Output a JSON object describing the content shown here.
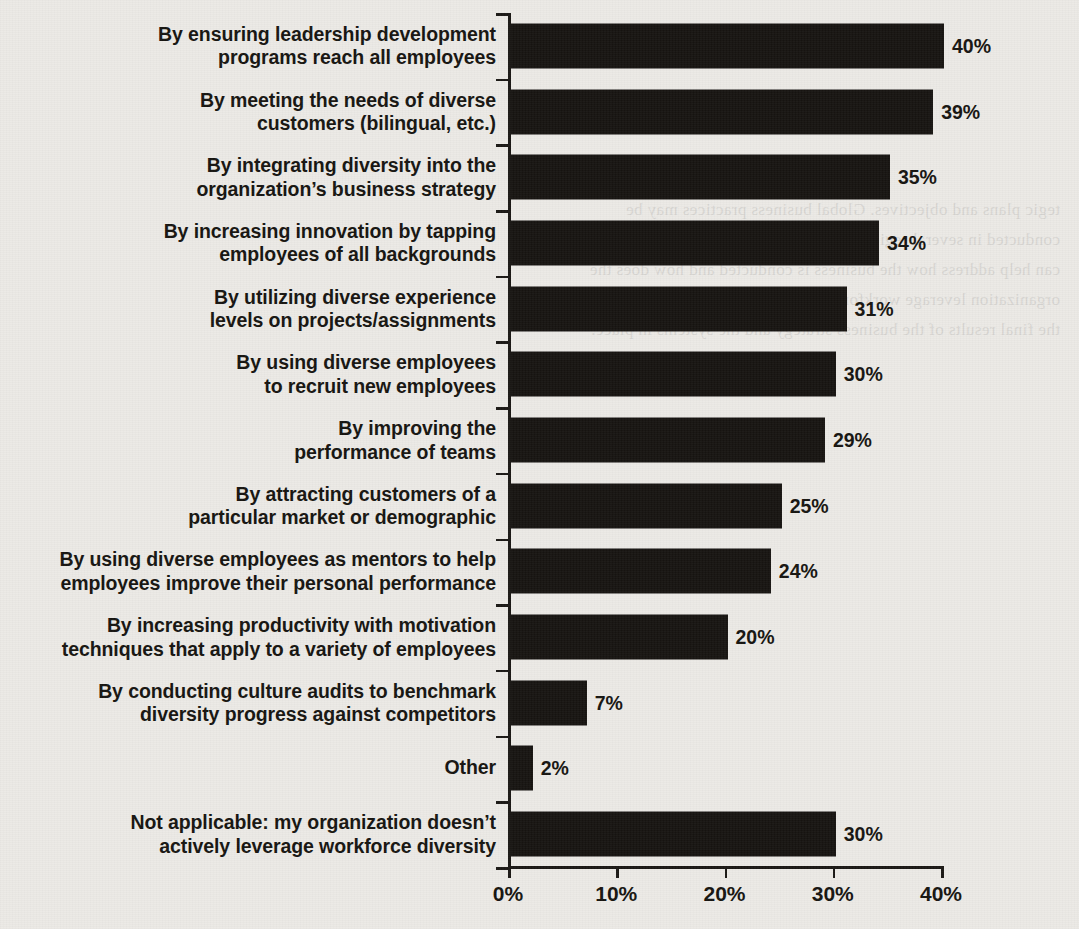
{
  "chart_data": {
    "type": "bar",
    "orientation": "horizontal",
    "title": "",
    "subtitle": "",
    "xlabel": "",
    "ylabel": "",
    "xlim": [
      0,
      40
    ],
    "grid": false,
    "legend": null,
    "xticks": [
      "0%",
      "10%",
      "20%",
      "30%",
      "40%"
    ],
    "xtick_values": [
      0,
      10,
      20,
      30,
      40
    ],
    "bar_color": "#161310",
    "background_color": "#eceae6",
    "text_color": "#15130f",
    "categories": [
      "By ensuring leadership development\nprograms reach all employees",
      "By meeting the needs of diverse\ncustomers (bilingual, etc.)",
      "By integrating diversity into the\norganization’s business strategy",
      "By increasing innovation by tapping\nemployees of all backgrounds",
      "By utilizing diverse experience\nlevels on projects/assignments",
      "By using diverse employees\nto recruit new employees",
      "By improving the\nperformance of teams",
      "By attracting customers of a\nparticular market or demographic",
      "By using diverse employees as mentors to help\nemployees improve their personal performance",
      "By increasing productivity with motivation\ntechniques that apply to a variety of employees",
      "By conducting culture audits to benchmark\ndiversity progress against competitors",
      "Other",
      "Not applicable: my organization doesn’t\nactively leverage workforce diversity"
    ],
    "values": [
      40,
      39,
      35,
      34,
      31,
      30,
      29,
      25,
      24,
      20,
      7,
      2,
      30
    ],
    "value_labels": [
      "40%",
      "39%",
      "35%",
      "34%",
      "31%",
      "30%",
      "29%",
      "25%",
      "24%",
      "20%",
      "7%",
      "2%",
      "30%"
    ]
  },
  "page": {
    "bleed_through_text": "tegic plans and objectives. Global business practices may be conducted in several regions of the world, and a diverse workforce can help address how the business is conducted and how does the organization leverage workforce diversity. Such approaches affect the final results of the business strategy and the systems in place."
  }
}
